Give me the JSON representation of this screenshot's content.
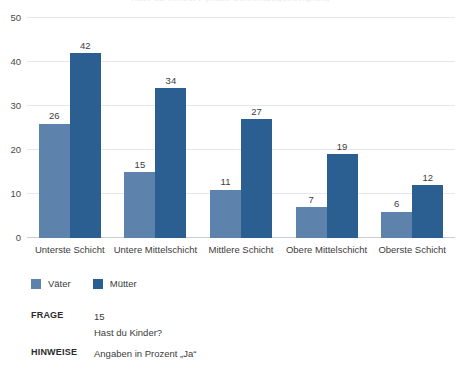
{
  "chart_data": {
    "type": "bar",
    "title": "Hast du Kinder? (nach Schichtzugehörigkeit)",
    "xlabel": "",
    "ylabel": "",
    "ylim": [
      0,
      50
    ],
    "yticks": [
      0,
      10,
      20,
      30,
      40,
      50
    ],
    "grid": true,
    "legend_position": "bottom-left",
    "categories": [
      "Unterste Schicht",
      "Untere Mittelschicht",
      "Mittlere Schicht",
      "Obere Mittelschicht",
      "Oberste Schicht"
    ],
    "series": [
      {
        "name": "Väter",
        "color": "#5d82ab",
        "values": [
          26,
          15,
          11,
          7,
          6
        ]
      },
      {
        "name": "Mütter",
        "color": "#2b5f91",
        "values": [
          42,
          34,
          27,
          19,
          12
        ]
      }
    ]
  },
  "notes": {
    "frage_key": "FRAGE",
    "frage_number": "15",
    "frage_text": "Hast du Kinder?",
    "hinweise_key": "HINWEISE",
    "hinweise_text": "Angaben in Prozent „Ja“"
  },
  "colors": {
    "vaeter": "#5d82ab",
    "muetter": "#2b5f91",
    "grid": "#e4e8ed",
    "text": "#3c3c3c"
  }
}
